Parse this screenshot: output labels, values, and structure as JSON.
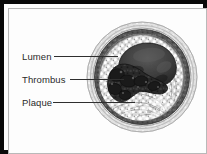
{
  "figure": {
    "kind": "medical-illustration",
    "style": "grayscale halftone drawing",
    "frame": {
      "border_color": "#0a0a0a",
      "inner_rule_color": "#b9b9b9",
      "background_color": "#ffffff"
    }
  },
  "labels": [
    {
      "id": "lumen",
      "text": "Lumen",
      "leader": "line-right"
    },
    {
      "id": "thrombus",
      "text": "Thrombus",
      "leader": "line-right"
    },
    {
      "id": "plaque",
      "text": "Plaque",
      "leader": "line-right"
    }
  ],
  "illustration": {
    "regions": [
      {
        "id": "adventitia",
        "name": "outer vessel wall",
        "tone": "#d9d9d9"
      },
      {
        "id": "media",
        "name": "muscular media ring",
        "tone": "#5e5e5e"
      },
      {
        "id": "intima",
        "name": "inner wall ring",
        "tone": "#9a9a9a"
      },
      {
        "id": "plaque-mass",
        "name": "plaque",
        "tone": "#cfcfcf"
      },
      {
        "id": "thrombus-mass",
        "name": "thrombus",
        "tone": "#2b2b2b"
      },
      {
        "id": "lumen-cavity",
        "name": "lumen",
        "tone": "#4a4a4a"
      }
    ],
    "colors": {
      "ink": "#2f2f2f",
      "dark": "#242424",
      "mid": "#6b6b6b",
      "light": "#d5d5d5",
      "paper": "#fdfdfd"
    }
  }
}
